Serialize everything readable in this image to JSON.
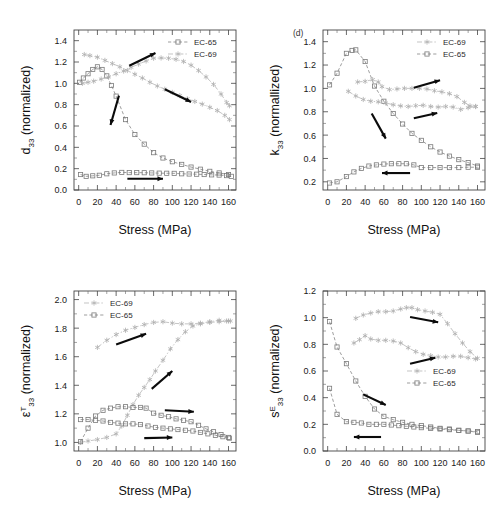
{
  "figure": {
    "width": 499,
    "height": 523,
    "background": "#ffffff",
    "series_colors": {
      "EC-65": "#8d8d8d",
      "EC-69": "#b9b9b9",
      "arrow": "#0b0b0b"
    }
  },
  "chart_data": [
    {
      "id": "panel-d33",
      "type": "line",
      "position": "top-left",
      "title": "",
      "panel_label": "",
      "xlabel": "Stress (MPa)",
      "ylabel": "d33 (normalized)",
      "ylabel_parts": {
        "base": "d",
        "sub": "33",
        "sup": "",
        "suffix": " (normalized)"
      },
      "xlim": [
        -5,
        168
      ],
      "ylim": [
        0.0,
        1.5
      ],
      "xticks": [
        0,
        20,
        40,
        60,
        80,
        100,
        120,
        140,
        160
      ],
      "yticks": [
        0.0,
        0.2,
        0.4,
        0.6,
        0.8,
        1.0,
        1.2,
        1.4
      ],
      "grid": false,
      "legend_position": "top-right",
      "legend": [
        "EC-65",
        "EC-69"
      ],
      "series": [
        {
          "name": "EC-65",
          "marker": "square",
          "branch": "upper",
          "x": [
            1,
            5,
            10,
            15,
            20,
            25,
            30,
            35,
            40,
            50,
            60,
            70,
            80,
            90,
            100,
            110,
            120,
            130,
            140,
            150,
            160
          ],
          "values": [
            1.01,
            1.05,
            1.09,
            1.13,
            1.155,
            1.13,
            1.07,
            0.98,
            0.88,
            0.66,
            0.52,
            0.43,
            0.35,
            0.3,
            0.265,
            0.24,
            0.215,
            0.195,
            0.175,
            0.16,
            0.145
          ]
        },
        {
          "name": "EC-65",
          "marker": "square",
          "branch": "lower",
          "x": [
            2,
            8,
            15,
            22,
            30,
            38,
            46,
            54,
            62,
            70,
            78,
            86,
            94,
            102,
            110,
            118,
            126,
            134,
            142,
            150,
            158,
            163
          ],
          "values": [
            0.145,
            0.128,
            0.133,
            0.138,
            0.152,
            0.16,
            0.165,
            0.163,
            0.163,
            0.162,
            0.16,
            0.158,
            0.157,
            0.156,
            0.152,
            0.15,
            0.148,
            0.145,
            0.142,
            0.14,
            0.135,
            0.128
          ]
        },
        {
          "name": "EC-69",
          "marker": "star",
          "branch": "rising",
          "x": [
            4,
            10,
            16,
            24,
            32,
            40,
            48,
            56,
            64,
            72,
            80,
            88,
            96,
            104,
            112,
            120,
            128,
            136,
            144,
            152,
            158,
            161
          ],
          "values": [
            1.0,
            1.01,
            1.02,
            1.04,
            1.06,
            1.09,
            1.115,
            1.15,
            1.18,
            1.21,
            1.235,
            1.238,
            1.235,
            1.225,
            1.205,
            1.17,
            1.12,
            1.06,
            0.99,
            0.9,
            0.82,
            0.79
          ]
        },
        {
          "name": "EC-69",
          "marker": "star",
          "branch": "falling",
          "x": [
            6,
            12,
            20,
            28,
            36,
            44,
            52,
            60,
            68,
            76,
            84,
            92,
            100,
            108,
            116,
            124,
            132,
            140,
            148,
            156,
            161
          ],
          "values": [
            1.27,
            1.26,
            1.245,
            1.215,
            1.185,
            1.155,
            1.12,
            1.085,
            1.05,
            1.01,
            0.975,
            0.945,
            0.915,
            0.885,
            0.855,
            0.83,
            0.805,
            0.775,
            0.745,
            0.7,
            0.66
          ]
        }
      ],
      "arrows": [
        {
          "x1": 54,
          "y1": 1.165,
          "x2": 82,
          "y2": 1.285
        },
        {
          "x1": 43,
          "y1": 0.885,
          "x2": 34,
          "y2": 0.61
        },
        {
          "x1": 92,
          "y1": 0.945,
          "x2": 120,
          "y2": 0.825
        },
        {
          "x1": 52,
          "y1": 0.105,
          "x2": 90,
          "y2": 0.105
        }
      ]
    },
    {
      "id": "panel-k33",
      "type": "line",
      "position": "top-right",
      "title": "",
      "panel_label": "(d)",
      "xlabel": "Stress (MPa)",
      "ylabel": "k33 (normallized)",
      "ylabel_parts": {
        "base": "k",
        "sub": "33",
        "sup": "",
        "suffix": " (normallized)"
      },
      "xlim": [
        -5,
        168
      ],
      "ylim": [
        0.13,
        1.5
      ],
      "xticks": [
        0,
        20,
        40,
        60,
        80,
        100,
        120,
        140,
        160
      ],
      "yticks": [
        0.2,
        0.4,
        0.6,
        0.8,
        1.0,
        1.2,
        1.4
      ],
      "grid": false,
      "legend_position": "top-right",
      "legend": [
        "EC-69",
        "EC-65"
      ],
      "series": [
        {
          "name": "EC-65",
          "marker": "square",
          "branch": "upper",
          "x": [
            2,
            10,
            20,
            26,
            30,
            40,
            50,
            60,
            70,
            80,
            90,
            100,
            110,
            120,
            130,
            140,
            150,
            160
          ],
          "values": [
            1.03,
            1.13,
            1.3,
            1.325,
            1.33,
            1.23,
            1.02,
            0.89,
            0.785,
            0.695,
            0.615,
            0.555,
            0.5,
            0.455,
            0.42,
            0.39,
            0.365,
            0.335
          ]
        },
        {
          "name": "EC-65",
          "marker": "square",
          "branch": "lower",
          "x": [
            2,
            10,
            20,
            28,
            36,
            44,
            52,
            60,
            68,
            76,
            84,
            92,
            100,
            110,
            120,
            130,
            140,
            150,
            160
          ],
          "values": [
            0.19,
            0.2,
            0.245,
            0.285,
            0.315,
            0.335,
            0.345,
            0.352,
            0.355,
            0.355,
            0.355,
            0.345,
            0.322,
            0.322,
            0.322,
            0.322,
            0.322,
            0.325,
            0.325
          ]
        },
        {
          "name": "EC-69",
          "marker": "star",
          "branch": "upper",
          "x": [
            32,
            40,
            48,
            54,
            58,
            66,
            74,
            82,
            90,
            98,
            106,
            114,
            122,
            130,
            138,
            146,
            152,
            158
          ],
          "values": [
            1.055,
            1.06,
            1.075,
            1.055,
            1.015,
            0.99,
            0.995,
            1.0,
            1.0,
            1.0,
            0.995,
            0.98,
            0.97,
            0.955,
            0.93,
            0.88,
            0.85,
            0.845
          ]
        },
        {
          "name": "EC-69",
          "marker": "star",
          "branch": "lower",
          "x": [
            22,
            30,
            38,
            46,
            54,
            62,
            70,
            78,
            86,
            94,
            102,
            110,
            118,
            126,
            134,
            142,
            150,
            158
          ],
          "values": [
            0.975,
            0.935,
            0.905,
            0.89,
            0.885,
            0.875,
            0.86,
            0.85,
            0.845,
            0.852,
            0.855,
            0.845,
            0.84,
            0.845,
            0.84,
            0.82,
            0.835,
            0.845
          ]
        }
      ],
      "arrows": [
        {
          "x1": 92,
          "y1": 1.005,
          "x2": 120,
          "y2": 1.07
        },
        {
          "x1": 47,
          "y1": 0.785,
          "x2": 62,
          "y2": 0.57
        },
        {
          "x1": 92,
          "y1": 0.745,
          "x2": 117,
          "y2": 0.79
        },
        {
          "x1": 88,
          "y1": 0.275,
          "x2": 58,
          "y2": 0.275
        }
      ]
    },
    {
      "id": "panel-eps33",
      "type": "line",
      "position": "bottom-left",
      "title": "",
      "panel_label": "",
      "xlabel": "Stress (MPa)",
      "ylabel": "eT33 (normalized)",
      "ylabel_parts": {
        "base": "ε",
        "sub": "33",
        "sup": "T",
        "suffix": " (normalized)"
      },
      "xlim": [
        -5,
        168
      ],
      "ylim": [
        0.94,
        2.06
      ],
      "xticks": [
        0,
        20,
        40,
        60,
        80,
        100,
        120,
        140,
        160
      ],
      "yticks": [
        1.0,
        1.2,
        1.4,
        1.6,
        1.8,
        2.0
      ],
      "grid": false,
      "legend_position": "top-left",
      "legend": [
        "EC-69",
        "EC-65"
      ],
      "series": [
        {
          "name": "EC-69",
          "marker": "star",
          "branch": "upper",
          "x": [
            20,
            30,
            40,
            50,
            60,
            70,
            80,
            90,
            100,
            110,
            120,
            130,
            140,
            150,
            158,
            162
          ],
          "values": [
            1.665,
            1.715,
            1.755,
            1.785,
            1.805,
            1.825,
            1.84,
            1.845,
            1.835,
            1.83,
            1.83,
            1.835,
            1.845,
            1.855,
            1.85,
            1.85
          ]
        },
        {
          "name": "EC-69",
          "marker": "star",
          "branch": "rising",
          "x": [
            2,
            10,
            20,
            30,
            40,
            46,
            52,
            58,
            64,
            70,
            76,
            82,
            90,
            98,
            106,
            114,
            122,
            130,
            140,
            150,
            160
          ],
          "values": [
            1.0,
            1.01,
            1.02,
            1.035,
            1.06,
            1.115,
            1.19,
            1.265,
            1.33,
            1.385,
            1.44,
            1.5,
            1.575,
            1.655,
            1.72,
            1.775,
            1.815,
            1.83,
            1.84,
            1.845,
            1.85
          ]
        },
        {
          "name": "EC-65",
          "marker": "square",
          "branch": "upper",
          "x": [
            2,
            10,
            18,
            26,
            34,
            42,
            50,
            58,
            66,
            72,
            80,
            88,
            96,
            104,
            112,
            120,
            128,
            136,
            144,
            152,
            160
          ],
          "values": [
            1.005,
            1.1,
            1.185,
            1.225,
            1.24,
            1.25,
            1.25,
            1.245,
            1.245,
            1.24,
            1.205,
            1.19,
            1.18,
            1.165,
            1.155,
            1.145,
            1.12,
            1.095,
            1.075,
            1.055,
            1.035
          ]
        },
        {
          "name": "EC-65",
          "marker": "square",
          "branch": "lower",
          "x": [
            2,
            10,
            18,
            26,
            34,
            42,
            50,
            58,
            66,
            74,
            82,
            90,
            98,
            106,
            114,
            122,
            130,
            138,
            146,
            154,
            161
          ],
          "values": [
            1.16,
            1.16,
            1.155,
            1.15,
            1.14,
            1.135,
            1.13,
            1.13,
            1.125,
            1.115,
            1.105,
            1.1,
            1.095,
            1.09,
            1.085,
            1.08,
            1.07,
            1.06,
            1.05,
            1.04,
            1.03
          ]
        }
      ],
      "arrows": [
        {
          "x1": 40,
          "y1": 1.685,
          "x2": 72,
          "y2": 1.76
        },
        {
          "x1": 78,
          "y1": 1.375,
          "x2": 100,
          "y2": 1.5
        },
        {
          "x1": 92,
          "y1": 1.225,
          "x2": 123,
          "y2": 1.215
        },
        {
          "x1": 70,
          "y1": 1.03,
          "x2": 100,
          "y2": 1.035
        }
      ]
    },
    {
      "id": "panel-s33",
      "type": "line",
      "position": "bottom-right",
      "title": "",
      "panel_label": "",
      "xlabel": "Stress (MPa)",
      "ylabel": "sE33 (normalized)",
      "ylabel_parts": {
        "base": "s",
        "sub": "33",
        "sup": "E",
        "suffix": " (normalized)"
      },
      "xlim": [
        -5,
        168
      ],
      "ylim": [
        0.0,
        1.2
      ],
      "xticks": [
        0,
        20,
        40,
        60,
        80,
        100,
        120,
        140,
        160
      ],
      "yticks": [
        0.0,
        0.2,
        0.4,
        0.6,
        0.8,
        1.0,
        1.2
      ],
      "grid": false,
      "legend_position": "middle-right",
      "legend": [
        "EC-69",
        "EC-65"
      ],
      "series": [
        {
          "name": "EC-65",
          "marker": "square",
          "branch": "upper",
          "x": [
            2,
            10,
            20,
            30,
            40,
            50,
            60,
            70,
            80,
            90,
            100,
            110,
            120,
            130,
            140,
            150,
            160
          ],
          "values": [
            0.97,
            0.78,
            0.655,
            0.525,
            0.41,
            0.315,
            0.26,
            0.235,
            0.215,
            0.2,
            0.19,
            0.18,
            0.17,
            0.165,
            0.155,
            0.15,
            0.14
          ]
        },
        {
          "name": "EC-65",
          "marker": "square",
          "branch": "lower",
          "x": [
            2,
            10,
            20,
            28,
            36,
            44,
            52,
            60,
            68,
            76,
            84,
            92,
            100,
            110,
            120,
            130,
            140,
            150,
            160
          ],
          "values": [
            0.47,
            0.275,
            0.22,
            0.215,
            0.21,
            0.2,
            0.2,
            0.2,
            0.195,
            0.19,
            0.185,
            0.18,
            0.175,
            0.17,
            0.165,
            0.16,
            0.155,
            0.15,
            0.145
          ]
        },
        {
          "name": "EC-69",
          "marker": "star",
          "branch": "upper",
          "x": [
            30,
            38,
            46,
            54,
            62,
            70,
            78,
            84,
            90,
            96,
            104,
            112,
            120,
            128,
            136,
            144,
            152,
            160
          ],
          "values": [
            0.995,
            1.02,
            1.035,
            1.045,
            1.045,
            1.05,
            1.065,
            1.075,
            1.075,
            1.06,
            1.05,
            1.04,
            1.025,
            0.955,
            0.88,
            0.81,
            0.745,
            0.695
          ]
        },
        {
          "name": "EC-69",
          "marker": "star",
          "branch": "lower",
          "x": [
            28,
            34,
            40,
            46,
            54,
            62,
            70,
            78,
            86,
            94,
            102,
            110,
            118,
            126,
            134,
            142,
            150,
            158
          ],
          "values": [
            0.81,
            0.835,
            0.865,
            0.84,
            0.83,
            0.83,
            0.825,
            0.81,
            0.775,
            0.745,
            0.725,
            0.715,
            0.705,
            0.705,
            0.71,
            0.71,
            0.7,
            0.69
          ]
        }
      ],
      "arrows": [
        {
          "x1": 88,
          "y1": 1.005,
          "x2": 118,
          "y2": 0.965
        },
        {
          "x1": 88,
          "y1": 0.655,
          "x2": 115,
          "y2": 0.7
        },
        {
          "x1": 38,
          "y1": 0.425,
          "x2": 62,
          "y2": 0.345
        },
        {
          "x1": 57,
          "y1": 0.105,
          "x2": 28,
          "y2": 0.105
        }
      ]
    }
  ]
}
